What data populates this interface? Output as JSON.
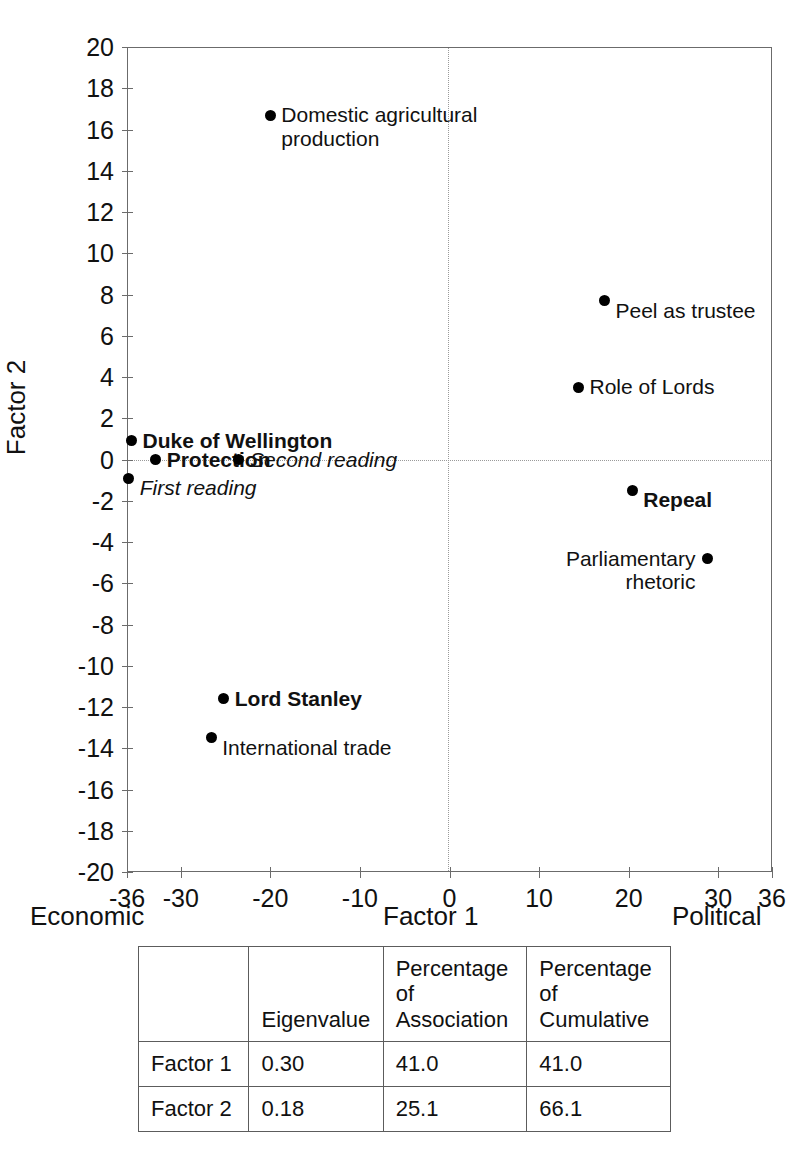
{
  "chart_data": {
    "type": "scatter",
    "title": "",
    "xlabel": "Factor 1",
    "ylabel": "Factor 2",
    "xlim": [
      -36,
      36
    ],
    "ylim": [
      -20,
      20
    ],
    "grid": false,
    "legend": "none",
    "x_axis_left_note": "Economic",
    "x_axis_right_note": "Political",
    "xticks": [
      -36,
      -30,
      -20,
      -10,
      0,
      10,
      20,
      30,
      36
    ],
    "xtick_labels": [
      "-36",
      "-30",
      "-20",
      "-10",
      "0",
      "10",
      "20",
      "30",
      "36"
    ],
    "yticks": [
      -20,
      -18,
      -16,
      -14,
      -12,
      -10,
      -8,
      -6,
      -4,
      -2,
      0,
      2,
      4,
      6,
      8,
      10,
      12,
      14,
      16,
      18,
      20
    ],
    "ytick_labels": [
      "-20",
      "-18",
      "-16",
      "-14",
      "-12",
      "-10",
      "-8",
      "-6",
      "-4",
      "-2",
      "0",
      "2",
      "4",
      "6",
      "8",
      "10",
      "12",
      "14",
      "16",
      "18",
      "20"
    ],
    "reference_lines": {
      "x": 0,
      "y": 0,
      "style": "dotted"
    },
    "points": [
      {
        "label": "Domestic agricultural\nproduction",
        "x": -20.0,
        "y": 16.7,
        "style": "plain",
        "label_pos": "right"
      },
      {
        "label": "Peel as trustee",
        "x": 17.3,
        "y": 7.7,
        "style": "plain",
        "label_pos": "below-right"
      },
      {
        "label": "Role of Lords",
        "x": 14.4,
        "y": 3.5,
        "style": "plain",
        "label_pos": "right"
      },
      {
        "label": "Duke of Wellington",
        "x": -35.5,
        "y": 0.9,
        "style": "bold",
        "label_pos": "right"
      },
      {
        "label": "Protection",
        "x": -32.8,
        "y": 0.0,
        "style": "bold",
        "label_pos": "right"
      },
      {
        "label": "Second reading",
        "x": -23.5,
        "y": 0.0,
        "style": "italic",
        "label_pos": "right"
      },
      {
        "label": "First reading",
        "x": -35.8,
        "y": -0.9,
        "style": "italic",
        "label_pos": "below-right"
      },
      {
        "label": "Repeal",
        "x": 20.4,
        "y": -1.5,
        "style": "bold",
        "label_pos": "below-right"
      },
      {
        "label": "Parliamentary\nrhetoric",
        "x": 28.8,
        "y": -4.8,
        "style": "plain",
        "label_pos": "left"
      },
      {
        "label": "Lord Stanley",
        "x": -25.2,
        "y": -11.6,
        "style": "bold",
        "label_pos": "right"
      },
      {
        "label": "International trade",
        "x": -26.6,
        "y": -13.5,
        "style": "plain",
        "label_pos": "below-right"
      }
    ]
  },
  "table": {
    "headers": [
      "",
      "Eigenvalue",
      "Percentage of Association",
      "Percentage of Cumulative"
    ],
    "headers_line1": [
      "",
      "Eigenvalue",
      "Percentage of",
      "Percentage of"
    ],
    "headers_line2": [
      "",
      "",
      "Association",
      "Cumulative"
    ],
    "rows": [
      {
        "name": "Factor 1",
        "eigenvalue": "0.30",
        "pct_association": "41.0",
        "pct_cumulative": "41.0"
      },
      {
        "name": "Factor 2",
        "eigenvalue": "0.18",
        "pct_association": "25.1",
        "pct_cumulative": "66.1"
      }
    ]
  },
  "colors": {
    "marker": "#000000",
    "axis": "#6b6b6b",
    "reference_line": "#9a9a9a",
    "text": "#111111"
  }
}
